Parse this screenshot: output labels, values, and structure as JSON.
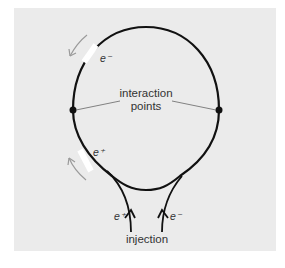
{
  "diagram": {
    "type": "collider-ring",
    "labels": {
      "interaction_line1": "interaction",
      "interaction_line2": "points",
      "electron_bunch": "e⁻",
      "positron_bunch": "e⁺",
      "injection": "injection",
      "inject_positron": "e⁺",
      "inject_electron": "e⁻"
    },
    "colors": {
      "background": "#ebebeb",
      "ring": "#111111",
      "bunch": "#ffffff",
      "direction_arrow": "#9a9a9a",
      "leader_line": "#666666",
      "text": "#333333"
    }
  }
}
